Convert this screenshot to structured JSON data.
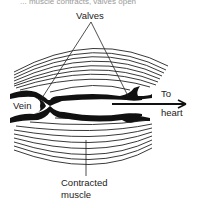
{
  "caption": "... muscle contracts, valves open",
  "labels": {
    "valves": "Valves",
    "vein": "Vein",
    "to": "To",
    "heart": "heart",
    "contracted_line1": "Contracted",
    "contracted_line2": "muscle"
  },
  "colors": {
    "ink": "#222222",
    "background": "#ffffff"
  }
}
